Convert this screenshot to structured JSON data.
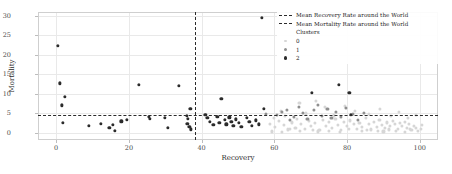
{
  "axes": {
    "xlabel": "Recovery",
    "ylabel": "Mortality",
    "xticks": [
      "0",
      "20",
      "40",
      "60",
      "80",
      "100"
    ],
    "yticks": [
      "0",
      "5",
      "10",
      "15",
      "20",
      "25",
      "30"
    ]
  },
  "legend": {
    "recovery_line_label": "Mean Recovery Rate around  the World",
    "mortality_line_label": "Mean Mortality Rate around  the World",
    "clusters_title": "Clusters",
    "cluster_labels": [
      "0",
      "1",
      "2"
    ]
  },
  "colors": {
    "cluster0": "#d6d6d6",
    "cluster1": "#8f8f8f",
    "cluster2": "#2b2b2b",
    "refline": "#2b2b2b",
    "grid": "#e9e9e9",
    "spine": "#cfcfcf"
  },
  "chart_data": {
    "type": "scatter",
    "title": "",
    "xlabel": "Recovery",
    "ylabel": "Mortality",
    "xlim": [
      -5,
      105
    ],
    "ylim": [
      -1.8,
      31
    ],
    "xticks": [
      0,
      20,
      40,
      60,
      80,
      100
    ],
    "yticks": [
      0,
      5,
      10,
      15,
      20,
      25,
      30
    ],
    "grid": true,
    "legend_position": "upper right",
    "annotations": [
      {
        "type": "vline",
        "x": 38.2,
        "style": "dashed",
        "label": "Mean Recovery Rate around  the World"
      },
      {
        "type": "hline",
        "y": 4.7,
        "style": "dashed",
        "label": "Mean Mortality Rate around  the World"
      }
    ],
    "series": [
      {
        "name": "2",
        "color": "#2b2b2b",
        "points": [
          [
            0.4,
            22.4
          ],
          [
            1.1,
            12.7
          ],
          [
            2.3,
            9.3
          ],
          [
            1.6,
            7.1
          ],
          [
            1.8,
            2.6
          ],
          [
            8.9,
            1.9
          ],
          [
            12.3,
            2.3
          ],
          [
            14.6,
            1.3
          ],
          [
            15.6,
            2.1
          ],
          [
            16.2,
            0.5
          ],
          [
            17.9,
            3.0
          ],
          [
            19.4,
            3.3
          ],
          [
            22.7,
            12.4
          ],
          [
            25.5,
            4.2
          ],
          [
            25.8,
            3.6
          ],
          [
            30.8,
            1.3
          ],
          [
            33.8,
            12.1
          ],
          [
            36.9,
            6.1
          ],
          [
            35.9,
            4.3
          ],
          [
            36.3,
            3.6
          ],
          [
            36.1,
            2.4
          ],
          [
            36.6,
            1.5
          ],
          [
            37.1,
            0.9
          ],
          [
            41.0,
            4.6
          ],
          [
            41.6,
            3.8
          ],
          [
            42.2,
            2.9
          ],
          [
            43.2,
            2.1
          ],
          [
            44.3,
            4.2
          ],
          [
            44.9,
            2.6
          ],
          [
            45.4,
            8.8
          ],
          [
            46.3,
            3.3
          ],
          [
            46.8,
            2.2
          ],
          [
            47.6,
            4.0
          ],
          [
            48.2,
            2.8
          ],
          [
            48.7,
            1.9
          ],
          [
            49.5,
            3.5
          ],
          [
            50.2,
            2.6
          ],
          [
            50.9,
            1.5
          ],
          [
            52.4,
            3.9
          ],
          [
            53.1,
            2.8
          ],
          [
            53.8,
            1.8
          ],
          [
            55.0,
            3.2
          ],
          [
            55.8,
            2.2
          ],
          [
            56.5,
            29.5
          ],
          [
            57.1,
            6.2
          ],
          [
            70.3,
            10.2
          ],
          [
            77.8,
            12.3
          ],
          [
            80.6,
            10.3
          ],
          [
            81.1,
            4.6
          ],
          [
            29.8,
            3.9
          ]
        ]
      },
      {
        "name": "1",
        "color": "#8f8f8f",
        "points": [
          [
            57.8,
            4.9
          ],
          [
            60.6,
            4.7
          ],
          [
            62.1,
            5.4
          ],
          [
            63.4,
            6.0
          ],
          [
            64.2,
            3.3
          ],
          [
            65.3,
            4.2
          ],
          [
            66.7,
            6.7
          ],
          [
            67.9,
            5.1
          ],
          [
            69.1,
            3.6
          ],
          [
            70.8,
            5.8
          ],
          [
            71.9,
            7.2
          ],
          [
            73.0,
            4.4
          ],
          [
            74.6,
            6.2
          ],
          [
            75.7,
            3.9
          ],
          [
            77.0,
            5.5
          ],
          [
            78.4,
            4.0
          ],
          [
            79.8,
            6.4
          ],
          [
            81.7,
            4.8
          ],
          [
            83.0,
            3.4
          ],
          [
            84.6,
            5.2
          ]
        ]
      },
      {
        "name": "0",
        "color": "#d6d6d6",
        "points": [
          [
            58.9,
            2.4
          ],
          [
            60.1,
            1.6
          ],
          [
            61.2,
            3.1
          ],
          [
            62.6,
            2.0
          ],
          [
            63.8,
            0.9
          ],
          [
            64.9,
            2.7
          ],
          [
            65.8,
            1.4
          ],
          [
            66.2,
            3.6
          ],
          [
            67.4,
            2.2
          ],
          [
            68.3,
            1.1
          ],
          [
            69.5,
            3.0
          ],
          [
            70.1,
            1.8
          ],
          [
            71.2,
            2.5
          ],
          [
            72.4,
            0.8
          ],
          [
            73.3,
            3.3
          ],
          [
            74.1,
            1.9
          ],
          [
            75.0,
            2.8
          ],
          [
            75.9,
            1.2
          ],
          [
            76.8,
            3.5
          ],
          [
            77.6,
            2.1
          ],
          [
            78.3,
            0.7
          ],
          [
            79.1,
            2.9
          ],
          [
            80.0,
            1.7
          ],
          [
            80.9,
            3.2
          ],
          [
            81.8,
            2.3
          ],
          [
            82.6,
            1.0
          ],
          [
            83.4,
            2.6
          ],
          [
            84.2,
            1.5
          ],
          [
            85.1,
            3.8
          ],
          [
            85.9,
            2.2
          ],
          [
            86.6,
            0.9
          ],
          [
            87.3,
            2.9
          ],
          [
            88.1,
            1.6
          ],
          [
            88.9,
            3.4
          ],
          [
            89.6,
            2.1
          ],
          [
            90.3,
            1.2
          ],
          [
            91.0,
            2.7
          ],
          [
            91.8,
            1.8
          ],
          [
            92.5,
            3.0
          ],
          [
            93.2,
            2.2
          ],
          [
            93.9,
            1.1
          ],
          [
            94.6,
            2.5
          ],
          [
            95.2,
            1.7
          ],
          [
            95.9,
            2.9
          ],
          [
            96.5,
            1.4
          ],
          [
            97.1,
            2.2
          ],
          [
            97.7,
            0.8
          ],
          [
            98.3,
            1.9
          ],
          [
            98.9,
            1.3
          ],
          [
            99.4,
            0.6
          ],
          [
            61.8,
            5.7
          ],
          [
            63.0,
            4.3
          ],
          [
            66.9,
            7.8
          ],
          [
            68.8,
            5.0
          ],
          [
            71.5,
            8.3
          ],
          [
            73.8,
            6.6
          ],
          [
            76.3,
            4.5
          ],
          [
            79.4,
            7.0
          ],
          [
            82.2,
            5.6
          ],
          [
            86.0,
            4.9
          ],
          [
            89.0,
            6.1
          ],
          [
            92.0,
            4.4
          ],
          [
            94.3,
            5.3
          ],
          [
            96.8,
            3.9
          ],
          [
            99.0,
            4.7
          ],
          [
            59.4,
            0.4
          ],
          [
            62.0,
            0.3
          ],
          [
            67.0,
            0.5
          ],
          [
            72.0,
            0.4
          ],
          [
            78.0,
            0.3
          ],
          [
            84.0,
            0.5
          ],
          [
            90.0,
            0.4
          ],
          [
            96.0,
            0.3
          ],
          [
            100.2,
            1.0
          ],
          [
            100.6,
            2.0
          ],
          [
            59.8,
            3.9
          ],
          [
            64.4,
            1.0
          ],
          [
            70.6,
            0.7
          ],
          [
            74.9,
            0.6
          ],
          [
            80.4,
            1.0
          ],
          [
            85.5,
            0.7
          ],
          [
            91.4,
            0.9
          ],
          [
            97.4,
            1.0
          ],
          [
            88.5,
            0.5
          ],
          [
            93.5,
            0.6
          ]
        ]
      }
    ]
  }
}
